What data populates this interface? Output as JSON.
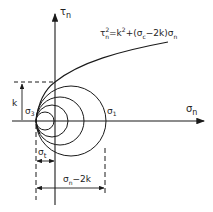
{
  "diagram": {
    "axes": {
      "x_label": "σ",
      "x_label_sub": "n",
      "y_label": "τ",
      "y_label_sub": "n"
    },
    "equation": {
      "lhs": "τ",
      "lhs_sup": "2",
      "lhs_sub": "n",
      "rhs_1": "=k",
      "rhs_1_sup": "2",
      "rhs_2": "+(σ",
      "rhs_2_sub": "c",
      "rhs_3": "−2k)σ",
      "rhs_3_sub": "n"
    },
    "labels": {
      "k": "k",
      "sigma3": "σ",
      "sigma3_sub": "3",
      "sigma1": "σ",
      "sigma1_sub": "1",
      "sigma_t": "σ",
      "sigma_t_sub": "t",
      "dim_bottom": "σ",
      "dim_bottom_sub": "n",
      "dim_bottom_rest": "−2k"
    },
    "circles_count": 4,
    "colors": {
      "stroke": "#1a1a1a",
      "background": "#ffffff"
    }
  }
}
